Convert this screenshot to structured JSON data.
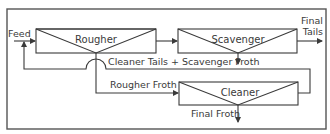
{
  "diagram": {
    "type": "flotation-circuit-flowsheet",
    "units": [
      {
        "id": "rougher",
        "label": "Rougher"
      },
      {
        "id": "scavenger",
        "label": "Scavenger"
      },
      {
        "id": "cleaner",
        "label": "Cleaner"
      }
    ],
    "streams": {
      "feed": "Feed",
      "final_tails_line1": "Final",
      "final_tails_line2": "Tails",
      "recycle": "Cleaner Tails + Scavenger Froth",
      "rougher_froth": "Rougher Froth",
      "final_froth": "Final Froth"
    },
    "colors": {
      "line": "#3a3a3a",
      "frame": "#555555",
      "background": "#ffffff"
    }
  }
}
